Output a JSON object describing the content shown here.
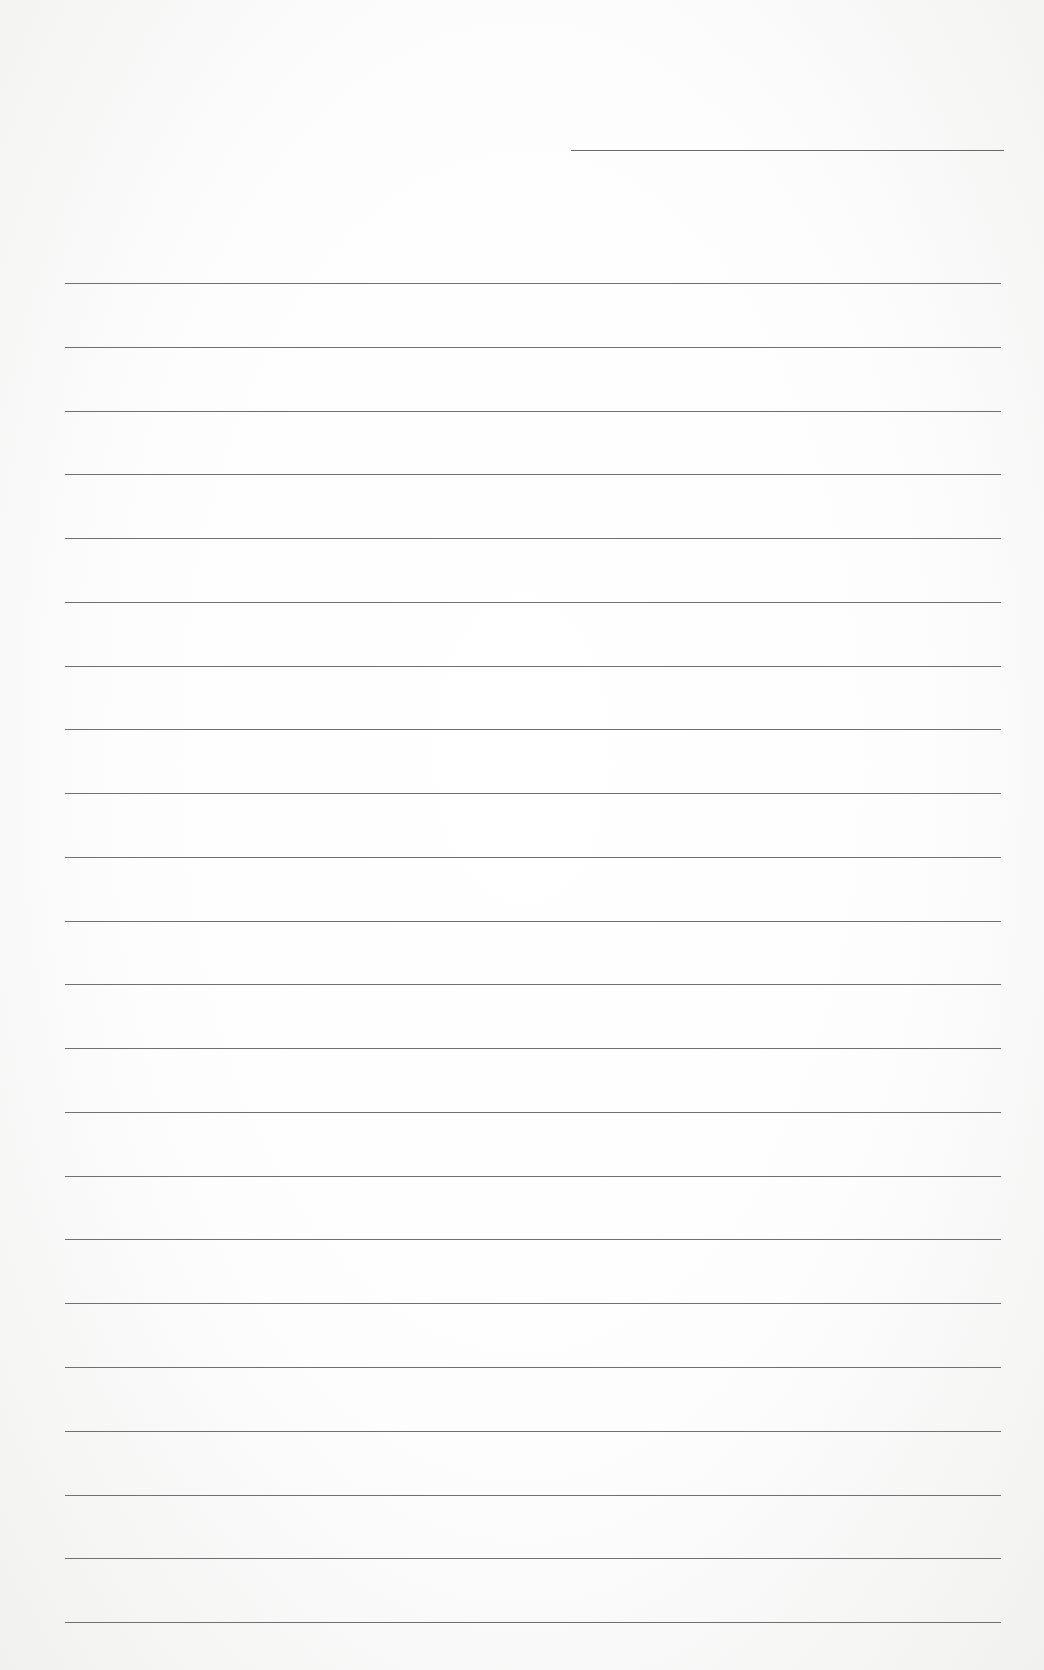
{
  "page": {
    "type": "blank lined paper",
    "header_line": {
      "label": ""
    },
    "rule_count": 22,
    "rules": []
  }
}
